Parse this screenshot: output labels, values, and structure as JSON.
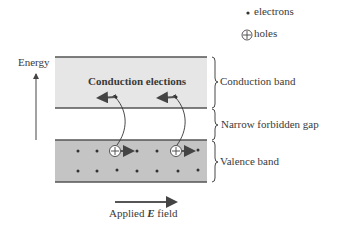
{
  "legend": {
    "electrons_label": "electrons",
    "holes_label": "holes"
  },
  "axis": {
    "energy_label": "Energy"
  },
  "bands": {
    "conduction_inner_label": "Conduction elections",
    "conduction_band_label": "Conduction band",
    "gap_label": "Narrow forbidden gap",
    "valence_band_label": "Valence band"
  },
  "field": {
    "label_prefix": "Applied ",
    "label_symbol": "E",
    "label_suffix": " field"
  },
  "colors": {
    "conduction_fill": "#e6e6e6",
    "valence_fill": "#c4c4c4",
    "edge": "#555555",
    "arrow": "#555555"
  }
}
